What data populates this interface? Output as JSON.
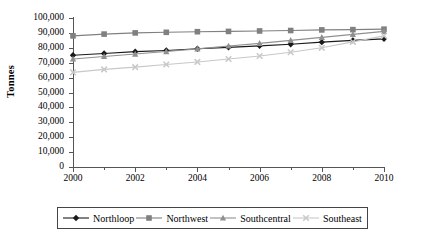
{
  "chart_data": {
    "type": "line",
    "title": "",
    "xlabel": "",
    "ylabel": "Tonnes",
    "x": [
      2000,
      2001,
      2002,
      2003,
      2004,
      2005,
      2006,
      2007,
      2008,
      2009,
      2010
    ],
    "xtick_labels": [
      "2000",
      "2002",
      "2004",
      "2006",
      "2008",
      "2010"
    ],
    "xtick_values": [
      2000,
      2002,
      2004,
      2006,
      2008,
      2010
    ],
    "ytick_labels": [
      "0",
      "10,000",
      "20,000",
      "30,000",
      "40,000",
      "50,000",
      "60,000",
      "70,000",
      "80,000",
      "90,000",
      "100,000"
    ],
    "ytick_values": [
      0,
      10000,
      20000,
      30000,
      40000,
      50000,
      60000,
      70000,
      80000,
      90000,
      100000
    ],
    "ylim": [
      0,
      100000
    ],
    "xlim": [
      2000,
      2010
    ],
    "grid": false,
    "legend_position": "bottom",
    "series": [
      {
        "name": "Northloop",
        "marker": "diamond",
        "color": "#1a1a1a",
        "values": [
          75000,
          76200,
          77400,
          78200,
          79400,
          80300,
          81300,
          82400,
          83800,
          85000,
          86000
        ]
      },
      {
        "name": "Northwest",
        "marker": "square",
        "color": "#808080",
        "values": [
          88000,
          89200,
          90000,
          90400,
          90800,
          91000,
          91300,
          91600,
          92000,
          92200,
          92500
        ]
      },
      {
        "name": "Southcentral",
        "marker": "triangle",
        "color": "#909090",
        "values": [
          72500,
          74200,
          75800,
          77500,
          79300,
          81200,
          83000,
          85000,
          87000,
          89000,
          91000
        ]
      },
      {
        "name": "Southeast",
        "marker": "x",
        "color": "#c8c8c8",
        "values": [
          63500,
          65500,
          67000,
          68800,
          70500,
          72500,
          74500,
          77000,
          80000,
          84000,
          88000
        ]
      }
    ]
  },
  "legend": {
    "items": [
      {
        "label": "Northloop",
        "marker": "diamond-marker",
        "color": "#1a1a1a"
      },
      {
        "label": "Northwest",
        "marker": "square-marker",
        "color": "#808080"
      },
      {
        "label": "Southcentral",
        "marker": "triangle-marker",
        "color": "#909090"
      },
      {
        "label": "Southeast",
        "marker": "x-marker",
        "color": "#c8c8c8"
      }
    ]
  }
}
